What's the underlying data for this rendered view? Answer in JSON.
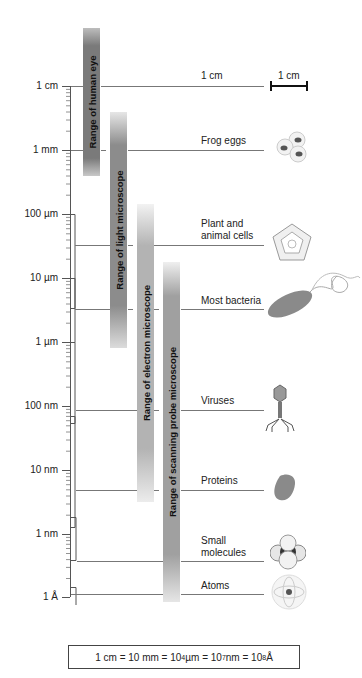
{
  "axis": {
    "ticks": [
      {
        "label": "1 cm",
        "y": 86
      },
      {
        "label": "1 mm",
        "y": 150
      },
      {
        "label": "100 µm",
        "y": 214
      },
      {
        "label": "10 µm",
        "y": 278
      },
      {
        "label": "1 µm",
        "y": 342
      },
      {
        "label": "100 nm",
        "y": 406
      },
      {
        "label": "10 nm",
        "y": 470
      },
      {
        "label": "1 nm",
        "y": 534
      },
      {
        "label": "1 Å",
        "y": 597
      }
    ]
  },
  "ranges": [
    {
      "label": "Range of human eye",
      "color": "#7a7a7a"
    },
    {
      "label": "Range of light microscope",
      "color": "#8c8c8c"
    },
    {
      "label": "Range of electron microscope",
      "color": "#b3b3b3"
    },
    {
      "label": "Range of scanning probe microscope",
      "color": "#a0a0a0"
    }
  ],
  "objects": [
    {
      "label": "1 cm",
      "icon": "scale-bar-icon"
    },
    {
      "label": "Frog eggs",
      "icon": "frog-eggs-icon"
    },
    {
      "label": "Plant and",
      "label2": "animal cells",
      "icon": "cell-icon"
    },
    {
      "label": "Most bacteria",
      "icon": "bacterium-icon"
    },
    {
      "label": "Viruses",
      "icon": "virus-icon"
    },
    {
      "label": "Proteins",
      "icon": "protein-icon"
    },
    {
      "label": "Small",
      "label2": "molecules",
      "icon": "molecule-icon"
    },
    {
      "label": "Atoms",
      "icon": "atom-icon"
    }
  ],
  "scale_bar": {
    "label": "1 cm"
  },
  "formula": {
    "p1": "1 cm = 10 mm = 10",
    "e1": "4",
    "p2": " µm = 10",
    "e2": "7",
    "p3": " nm = 10",
    "e3": "8",
    "p4": " Å"
  }
}
